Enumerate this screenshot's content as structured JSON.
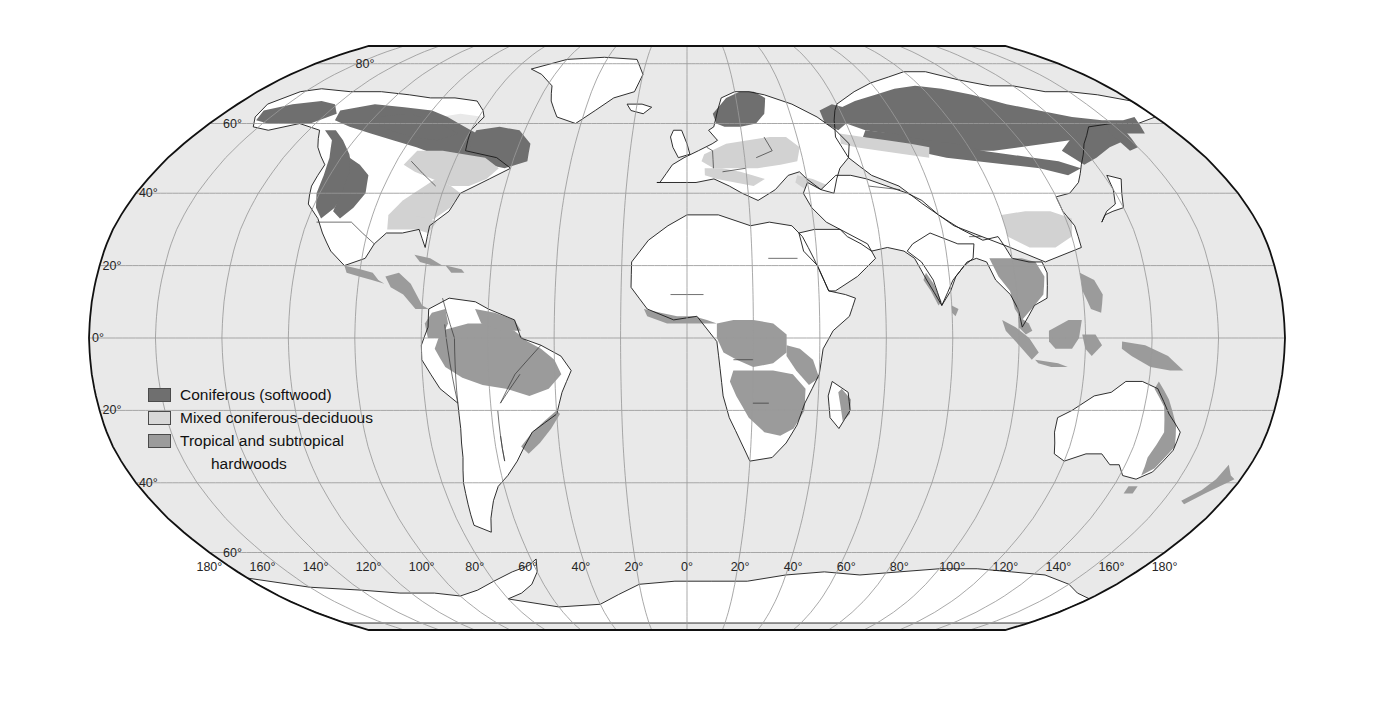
{
  "map": {
    "title": "World forest regions",
    "projection": "Robinson",
    "ocean_color": "#e9e9e9",
    "land_default_color": "#ffffff",
    "frame_color": "#111111",
    "graticule_color": "#9a9a9a"
  },
  "legend": {
    "items": [
      {
        "label": "Coniferous (softwood)",
        "color": "#6f6f6f",
        "swatch": "sw-con"
      },
      {
        "label": "Mixed coniferous-deciduous",
        "color": "#d8d8d8",
        "swatch": "sw-mix"
      },
      {
        "label": "Tropical and subtropical",
        "color": "#9b9b9b",
        "swatch": "sw-trop"
      }
    ],
    "continuation_line": "hardwoods"
  },
  "graticule": {
    "latitude_labels_north": [
      "80°",
      "60°",
      "40°",
      "20°",
      "0°"
    ],
    "latitude_labels_south": [
      "20°",
      "40°",
      "60°"
    ],
    "latitude_values": [
      80,
      60,
      40,
      20,
      0,
      -20,
      -40,
      -60
    ],
    "longitude_labels": [
      "180°",
      "160°",
      "140°",
      "120°",
      "100°",
      "80°",
      "60°",
      "40°",
      "20°",
      "0°",
      "20°",
      "40°",
      "60°",
      "80°",
      "100°",
      "120°",
      "140°",
      "160°",
      "180°"
    ],
    "longitude_values": [
      -180,
      -160,
      -140,
      -120,
      -100,
      -80,
      -60,
      -40,
      -20,
      0,
      20,
      40,
      60,
      80,
      100,
      120,
      140,
      160,
      180
    ],
    "latitude_interval_degrees": 20,
    "longitude_interval_degrees": 20
  },
  "labels": {
    "lat_80_n": "80°",
    "lat_60_n": "60°",
    "lat_40_n": "40°",
    "lat_20_n": "20°",
    "lat_0": "0°",
    "lat_20_s": "20°",
    "lat_40_s": "40°",
    "lat_60_s": "60°"
  },
  "chart_data": {
    "type": "map",
    "projection": "Robinson",
    "categories": [
      "Coniferous (softwood)",
      "Mixed coniferous-deciduous",
      "Tropical and subtropical hardwoods"
    ],
    "colors": [
      "#6f6f6f",
      "#d8d8d8",
      "#9b9b9b"
    ],
    "regions": [
      {
        "name": "Alaska / Yukon boreal",
        "class": "Coniferous (softwood)"
      },
      {
        "name": "Canadian boreal belt",
        "class": "Coniferous (softwood)"
      },
      {
        "name": "Pacific Northwest",
        "class": "Coniferous (softwood)"
      },
      {
        "name": "Rocky Mountains",
        "class": "Coniferous (softwood)"
      },
      {
        "name": "Eastern Canada / Labrador",
        "class": "Coniferous (softwood)"
      },
      {
        "name": "Scandinavia / Fennoscandia",
        "class": "Coniferous (softwood)"
      },
      {
        "name": "Siberian taiga",
        "class": "Coniferous (softwood)"
      },
      {
        "name": "Russian Far East",
        "class": "Coniferous (softwood)"
      },
      {
        "name": "Great Lakes / New England",
        "class": "Mixed coniferous-deciduous"
      },
      {
        "name": "Appalachians / US Southeast",
        "class": "Mixed coniferous-deciduous"
      },
      {
        "name": "Central Europe",
        "class": "Mixed coniferous-deciduous"
      },
      {
        "name": "Eastern Europe / Belarus",
        "class": "Mixed coniferous-deciduous"
      },
      {
        "name": "Caucasus / Black Sea coast",
        "class": "Mixed coniferous-deciduous"
      },
      {
        "name": "Southern China",
        "class": "Mixed coniferous-deciduous"
      },
      {
        "name": "Amazon basin",
        "class": "Tropical and subtropical hardwoods"
      },
      {
        "name": "Guiana Shield",
        "class": "Tropical and subtropical hardwoods"
      },
      {
        "name": "Atlantic Brazil",
        "class": "Tropical and subtropical hardwoods"
      },
      {
        "name": "Central America",
        "class": "Tropical and subtropical hardwoods"
      },
      {
        "name": "Caribbean islands",
        "class": "Tropical and subtropical hardwoods"
      },
      {
        "name": "West Africa / Guinea coast",
        "class": "Tropical and subtropical hardwoods"
      },
      {
        "name": "Congo basin",
        "class": "Tropical and subtropical hardwoods"
      },
      {
        "name": "Miombo / Southern Africa",
        "class": "Tropical and subtropical hardwoods"
      },
      {
        "name": "Madagascar east coast",
        "class": "Tropical and subtropical hardwoods"
      },
      {
        "name": "Indochina",
        "class": "Tropical and subtropical hardwoods"
      },
      {
        "name": "Western Ghats / Sri Lanka",
        "class": "Tropical and subtropical hardwoods"
      },
      {
        "name": "Sumatra / Borneo / Indonesia",
        "class": "Tropical and subtropical hardwoods"
      },
      {
        "name": "Philippines",
        "class": "Tropical and subtropical hardwoods"
      },
      {
        "name": "New Guinea",
        "class": "Tropical and subtropical hardwoods"
      },
      {
        "name": "Eastern Australia",
        "class": "Tropical and subtropical hardwoods"
      },
      {
        "name": "New Zealand",
        "class": "Tropical and subtropical hardwoods"
      }
    ],
    "xlabel": "Longitude",
    "ylabel": "Latitude",
    "xlim": [
      -180,
      180
    ],
    "ylim": [
      -90,
      90
    ],
    "grid": true,
    "legend_position": "center-left"
  }
}
